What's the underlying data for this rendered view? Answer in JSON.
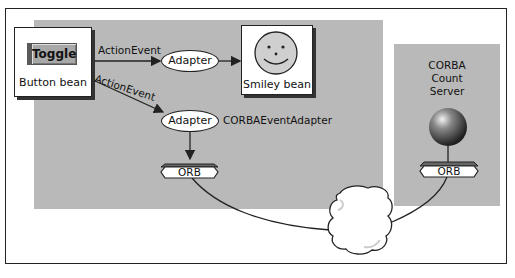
{
  "diagram": {
    "button_bean": {
      "button_label": "Toggle",
      "caption": "Button bean"
    },
    "smiley_bean": {
      "caption": "Smiley bean"
    },
    "edges": {
      "event_top": "ActionEvent",
      "event_diag": "ActionEvent"
    },
    "adapter_top": {
      "label": "Adapter"
    },
    "adapter_bottom": {
      "label": "Adapter",
      "caption": "CORBAEventAdapter"
    },
    "orb_client": {
      "label": "ORB"
    },
    "server": {
      "title_lines": [
        "CORBA",
        "Count",
        "Server"
      ],
      "orb_label": "ORB"
    },
    "network": {
      "shape": "cloud-icon"
    },
    "colors": {
      "panel": "#b9b9b9",
      "outline": "#222222",
      "background": "#ffffff"
    }
  }
}
